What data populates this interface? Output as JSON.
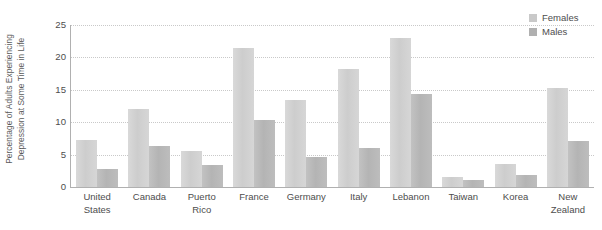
{
  "chart_data": {
    "type": "bar",
    "title": "",
    "xlabel": "",
    "ylabel": "Percentage of Adults Experiencing\nDepression at Some Time in Life",
    "ylim": [
      0,
      25
    ],
    "yticks": [
      0,
      5,
      10,
      15,
      20,
      25
    ],
    "ytick_labels": [
      "0",
      "5",
      "10",
      "15",
      "20",
      "25"
    ],
    "grid": true,
    "grid_axis": "y",
    "legend_position": "top-right",
    "categories": [
      "United\nStates",
      "Canada",
      "Puerto\nRico",
      "France",
      "Germany",
      "Italy",
      "Lebanon",
      "Taiwan",
      "Korea",
      "New\nZealand"
    ],
    "series": [
      {
        "name": "Females",
        "color": "#cdcdcd",
        "values": [
          7.2,
          12.0,
          5.6,
          21.5,
          13.4,
          18.2,
          23.0,
          1.6,
          3.6,
          15.3
        ]
      },
      {
        "name": "Males",
        "color": "#b4b4b4",
        "values": [
          2.8,
          6.4,
          3.4,
          10.3,
          4.6,
          6.0,
          14.4,
          1.1,
          1.8,
          7.1
        ]
      }
    ]
  },
  "legend": {
    "items": [
      {
        "label": "Females"
      },
      {
        "label": "Males"
      }
    ]
  },
  "colors": {
    "females": "#cdcdcd",
    "males": "#b4b4b4",
    "axis": "#b0b0b0",
    "gridline": "#c9c9c9",
    "text": "#4d4d4d",
    "background": "#ffffff"
  }
}
